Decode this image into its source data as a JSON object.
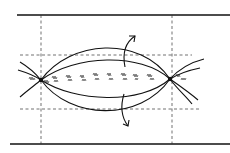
{
  "diagram": {
    "type": "line-art schematic",
    "canvas": {
      "width": 230,
      "height": 153,
      "background": "#ffffff"
    },
    "colors": {
      "ink": "#111111"
    },
    "boundaries": {
      "top_line": {
        "x1": 17,
        "y1": 15,
        "x2": 230,
        "y2": 15
      },
      "bottom_line": {
        "x1": 10,
        "y1": 144,
        "x2": 230,
        "y2": 144
      }
    },
    "dashed_guides": {
      "vertical": [
        41,
        172
      ],
      "horizontal": [
        {
          "y": 55,
          "x1": 20,
          "x2": 192
        },
        {
          "y": 109,
          "x1": 20,
          "x2": 200
        }
      ]
    },
    "nodes": [
      {
        "id": "left-node",
        "x": 41,
        "y": 80
      },
      {
        "id": "right-node",
        "x": 170,
        "y": 79
      }
    ],
    "arrows": [
      {
        "id": "upward-arrow",
        "direction": "up-right"
      },
      {
        "id": "downward-arrow",
        "direction": "down-right"
      }
    ],
    "glyph_marks": {
      "count": 12,
      "legible": false
    }
  }
}
